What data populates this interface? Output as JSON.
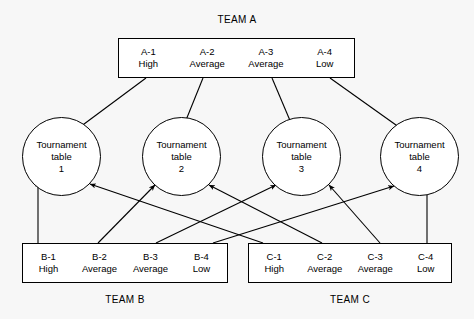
{
  "diagram": {
    "background_color": "#f7f7f7",
    "line_color": "#000000",
    "box_fill": "#ffffff"
  },
  "teams": [
    {
      "id": "team-a",
      "label": "TEAM A",
      "label_position": "above",
      "players": [
        {
          "code": "A-1",
          "rank": "High"
        },
        {
          "code": "A-2",
          "rank": "Average"
        },
        {
          "code": "A-3",
          "rank": "Average"
        },
        {
          "code": "A-4",
          "rank": "Low"
        }
      ]
    },
    {
      "id": "team-b",
      "label": "TEAM B",
      "label_position": "below",
      "players": [
        {
          "code": "B-1",
          "rank": "High"
        },
        {
          "code": "B-2",
          "rank": "Average"
        },
        {
          "code": "B-3",
          "rank": "Average"
        },
        {
          "code": "B-4",
          "rank": "Low"
        }
      ]
    },
    {
      "id": "team-c",
      "label": "TEAM C",
      "label_position": "below",
      "players": [
        {
          "code": "C-1",
          "rank": "High"
        },
        {
          "code": "C-2",
          "rank": "Average"
        },
        {
          "code": "C-3",
          "rank": "Average"
        },
        {
          "code": "C-4",
          "rank": "Low"
        }
      ]
    }
  ],
  "tables": [
    {
      "id": "table-1",
      "line1": "Tournament",
      "line2": "table",
      "number": "1"
    },
    {
      "id": "table-2",
      "line1": "Tournament",
      "line2": "table",
      "number": "2"
    },
    {
      "id": "table-3",
      "line1": "Tournament",
      "line2": "table",
      "number": "3"
    },
    {
      "id": "table-4",
      "line1": "Tournament",
      "line2": "table",
      "number": "4"
    }
  ],
  "connections": [
    {
      "from": "A-1",
      "to": "table-1"
    },
    {
      "from": "A-2",
      "to": "table-2"
    },
    {
      "from": "A-3",
      "to": "table-3"
    },
    {
      "from": "A-4",
      "to": "table-4"
    },
    {
      "from": "B-1",
      "to": "table-1"
    },
    {
      "from": "B-2",
      "to": "table-2"
    },
    {
      "from": "B-3",
      "to": "table-3"
    },
    {
      "from": "B-4",
      "to": "table-4"
    },
    {
      "from": "C-1",
      "to": "table-1"
    },
    {
      "from": "C-2",
      "to": "table-2"
    },
    {
      "from": "C-3",
      "to": "table-3"
    },
    {
      "from": "C-4",
      "to": "table-4"
    }
  ]
}
